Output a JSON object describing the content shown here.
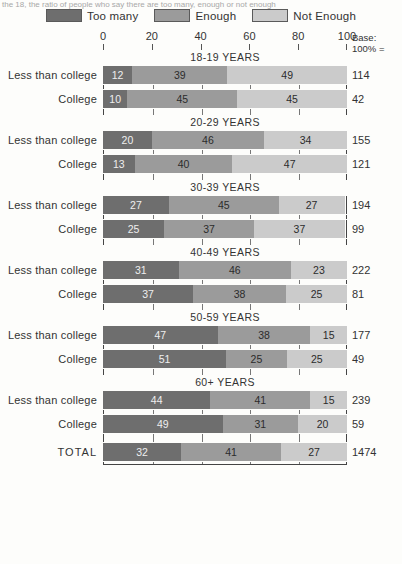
{
  "caption": "the 18, the ratio of people who say there are too many, enough or not enough",
  "legend": {
    "items": [
      {
        "label": "Too many",
        "color": "#6e6e6e"
      },
      {
        "label": "Enough",
        "color": "#9b9b9b"
      },
      {
        "label": "Not Enough",
        "color": "#cbcbcb"
      }
    ]
  },
  "axis": {
    "ticks": [
      "0",
      "20",
      "40",
      "60",
      "80",
      "100"
    ],
    "base_header_line1": "Base:",
    "base_header_line2": "100% ="
  },
  "chart_data": {
    "type": "bar",
    "title": "",
    "xlabel": "",
    "ylabel": "",
    "xlim": [
      0,
      100
    ],
    "stacked": true,
    "stack_total": 100,
    "orientation": "horizontal",
    "grid": true,
    "legend_position": "top",
    "series": [
      {
        "name": "Too many",
        "color": "#6e6e6e"
      },
      {
        "name": "Enough",
        "color": "#9b9b9b"
      },
      {
        "name": "Not Enough",
        "color": "#cbcbcb"
      }
    ],
    "groups": [
      {
        "title": "18-19 YEARS",
        "rows": [
          {
            "label": "Less than college",
            "values": [
              12,
              39,
              49
            ],
            "base": "114"
          },
          {
            "label": "College",
            "values": [
              10,
              45,
              45
            ],
            "base": "42"
          }
        ]
      },
      {
        "title": "20-29 YEARS",
        "rows": [
          {
            "label": "Less than college",
            "values": [
              20,
              46,
              34
            ],
            "base": "155"
          },
          {
            "label": "College",
            "values": [
              13,
              40,
              47
            ],
            "base": "121"
          }
        ]
      },
      {
        "title": "30-39 YEARS",
        "rows": [
          {
            "label": "Less than college",
            "values": [
              27,
              45,
              27
            ],
            "base": "194"
          },
          {
            "label": "College",
            "values": [
              25,
              37,
              37
            ],
            "base": "99"
          }
        ]
      },
      {
        "title": "40-49 YEARS",
        "rows": [
          {
            "label": "Less than college",
            "values": [
              31,
              46,
              23
            ],
            "base": "222"
          },
          {
            "label": "College",
            "values": [
              37,
              38,
              25
            ],
            "base": "81"
          }
        ]
      },
      {
        "title": "50-59 YEARS",
        "rows": [
          {
            "label": "Less than college",
            "values": [
              47,
              38,
              15
            ],
            "base": "177"
          },
          {
            "label": "College",
            "values": [
              51,
              25,
              25
            ],
            "base": "49"
          }
        ]
      },
      {
        "title": "60+  YEARS",
        "rows": [
          {
            "label": "Less than college",
            "values": [
              44,
              41,
              15
            ],
            "base": "239"
          },
          {
            "label": "College",
            "values": [
              49,
              31,
              20
            ],
            "base": "59"
          }
        ]
      }
    ],
    "total_row": {
      "label": "TOTAL",
      "values": [
        32,
        41,
        27
      ],
      "base": "1474"
    }
  }
}
